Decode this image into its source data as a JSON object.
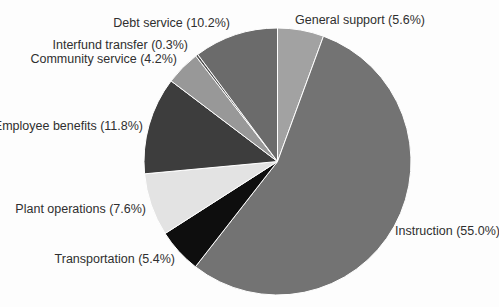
{
  "figure": {
    "background_color": "#fdfdfd",
    "text_color": "#2f2f2f"
  },
  "chart_data": {
    "type": "pie",
    "title": "",
    "legend": "none",
    "direction": "clockwise",
    "start_angle": "12-o-clock",
    "center": [
      277.5,
      161.5
    ],
    "radius": 133.5,
    "slice_stroke_color": "#ffffff",
    "segments": [
      {
        "name": "General support",
        "value": 5.6,
        "label": "General support (5.6%)",
        "color": "#a2a2a2",
        "label_side": "right"
      },
      {
        "name": "Instruction",
        "value": 55.0,
        "label": "Instruction (55.0%)",
        "color": "#737373",
        "label_side": "right"
      },
      {
        "name": "Transportation",
        "value": 5.4,
        "label": "Transportation (5.4%)",
        "color": "#0e0e0e",
        "label_side": "left"
      },
      {
        "name": "Plant operations",
        "value": 7.6,
        "label": "Plant operations (7.6%)",
        "color": "#e3e3e3",
        "label_side": "left"
      },
      {
        "name": "Employee benefits",
        "value": 11.8,
        "label": "Employee benefits (11.8%)",
        "color": "#3d3d3d",
        "label_side": "left"
      },
      {
        "name": "Community service",
        "value": 4.2,
        "label": "Community service (4.2%)",
        "color": "#989898",
        "label_side": "left"
      },
      {
        "name": "Interfund transfer",
        "value": 0.3,
        "label": "Interfund transfer (0.3%)",
        "color": "#525252",
        "label_side": "left"
      },
      {
        "name": "Debt service",
        "value": 10.2,
        "label": "Debt service (10.2%)",
        "color": "#6b6b6b",
        "label_side": "left"
      }
    ]
  }
}
